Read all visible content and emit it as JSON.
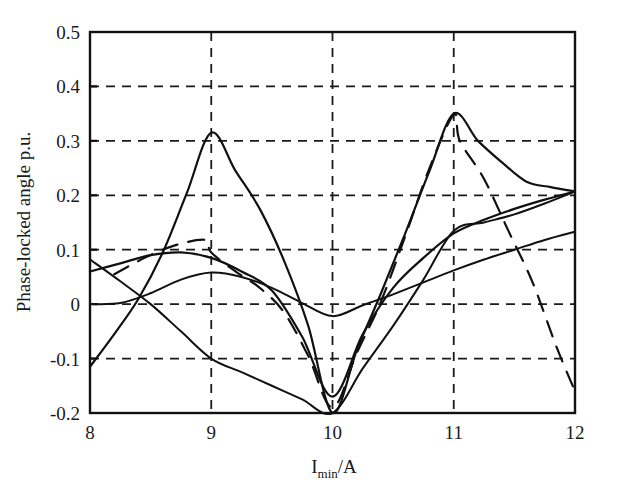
{
  "chart_data": {
    "type": "line",
    "title": "",
    "subtitle": "",
    "xlabel": "I_min/A",
    "xlabel_base": "I",
    "xlabel_sub": "min",
    "xlabel_tail": "/A",
    "ylabel": "Phase-locked angle p.u.",
    "xlim": [
      8,
      12
    ],
    "ylim": [
      -0.2,
      0.5
    ],
    "xticks": [
      8,
      9,
      10,
      11,
      12
    ],
    "xtick_labels": [
      "8",
      "9",
      "10",
      "11",
      "12"
    ],
    "yticks": [
      -0.2,
      -0.1,
      0,
      0.1,
      0.2,
      0.3,
      0.4,
      0.5
    ],
    "ytick_labels": [
      "-0.2",
      "-0.1",
      "0",
      "0.1",
      "0.2",
      "0.3",
      "0.4",
      "0.5"
    ],
    "grid": true,
    "grid_style": "dashed",
    "grid_color": "#1a1a1a",
    "legend": "none",
    "line_color": "#111111",
    "background": "#ffffff",
    "series": [
      {
        "name": "sharp-peak-curve",
        "style": "solid",
        "width": 2.2,
        "x": [
          8.0,
          8.2,
          8.4,
          8.6,
          8.8,
          9.0,
          9.2,
          9.4,
          9.6,
          9.8,
          10.0,
          10.2,
          10.4,
          10.6,
          10.8,
          11.0,
          11.2,
          11.4,
          11.6,
          11.8,
          12.0
        ],
        "y": [
          -0.115,
          -0.055,
          0.01,
          0.095,
          0.205,
          0.315,
          0.245,
          0.175,
          0.08,
          -0.04,
          -0.2,
          -0.085,
          0.02,
          0.13,
          0.245,
          0.35,
          0.3,
          0.26,
          0.225,
          0.215,
          0.207
        ]
      },
      {
        "name": "broad-rising-curve",
        "style": "solid",
        "width": 2.2,
        "x": [
          8.0,
          8.25,
          8.5,
          8.75,
          9.0,
          9.25,
          9.5,
          9.75,
          10.0,
          10.25,
          10.5,
          10.75,
          11.0,
          11.25,
          11.5,
          11.75,
          12.0
        ],
        "y": [
          0.06,
          0.075,
          0.09,
          0.095,
          0.085,
          0.06,
          0.025,
          -0.06,
          -0.17,
          -0.055,
          0.03,
          0.085,
          0.13,
          0.155,
          0.175,
          0.192,
          0.207
        ]
      },
      {
        "name": "shallow-arc-curve",
        "style": "solid",
        "width": 2.0,
        "x": [
          8.0,
          8.25,
          8.5,
          8.75,
          9.0,
          9.25,
          9.5,
          9.75,
          10.0,
          10.25,
          10.5,
          10.75,
          11.0,
          11.25,
          11.5,
          11.75,
          12.0
        ],
        "y": [
          0.0,
          0.002,
          0.02,
          0.045,
          0.058,
          0.05,
          0.03,
          0.002,
          -0.022,
          -0.002,
          0.018,
          0.04,
          0.062,
          0.082,
          0.1,
          0.118,
          0.133
        ]
      },
      {
        "name": "descending-then-rising-curve",
        "style": "solid",
        "width": 2.0,
        "x": [
          8.0,
          8.25,
          8.5,
          8.75,
          9.0,
          9.25,
          9.5,
          9.75,
          10.0,
          10.25,
          10.5,
          10.75,
          11.0,
          11.25,
          11.5,
          11.75,
          12.0
        ],
        "y": [
          0.082,
          0.042,
          0.0,
          -0.05,
          -0.1,
          -0.125,
          -0.15,
          -0.175,
          -0.2,
          -0.118,
          -0.04,
          0.045,
          0.135,
          0.15,
          0.165,
          0.185,
          0.207
        ]
      },
      {
        "name": "long-dashed-curve",
        "style": "dashed",
        "width": 2.2,
        "x": [
          8.2,
          8.45,
          8.7,
          8.95,
          9.0,
          9.2,
          9.4,
          9.6,
          9.8,
          10.0,
          10.2,
          10.4,
          10.6,
          10.8,
          11.0,
          11.05,
          11.25,
          11.45,
          11.65,
          11.85,
          12.0
        ],
        "y": [
          0.055,
          0.085,
          0.108,
          0.118,
          0.095,
          0.06,
          0.03,
          -0.015,
          -0.095,
          -0.19,
          -0.09,
          0.005,
          0.125,
          0.25,
          0.348,
          0.3,
          0.23,
          0.135,
          0.04,
          -0.08,
          -0.16
        ]
      }
    ]
  }
}
